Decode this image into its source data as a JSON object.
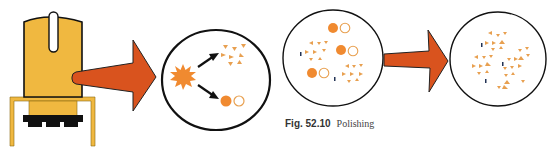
{
  "figure": {
    "number": "Fig. 52.10",
    "title": "Polishing"
  },
  "colors": {
    "device_body": "#F0B840",
    "device_outline": "#111111",
    "arrow": "#D9531E",
    "arrow_outline": "#222222",
    "particle": "#F08A30",
    "fragment": "#E8A050",
    "circle_outline": "#111111",
    "dark_mark": "#223355"
  },
  "panels": [
    {
      "id": "polishing-device",
      "label": "Polishing handpiece"
    },
    {
      "id": "process-circle",
      "label": "Abrasive breakdown"
    },
    {
      "id": "mid-stage-circle",
      "label": "Partially polished surface"
    },
    {
      "id": "final-circle",
      "label": "Polished surface"
    }
  ]
}
